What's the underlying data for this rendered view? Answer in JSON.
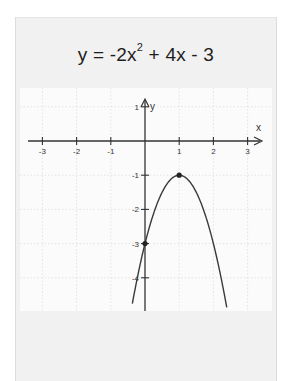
{
  "card": {
    "title_prefix": "y = -2x",
    "title_exp": "2",
    "title_suffix": " + 4x - 3"
  },
  "chart_data": {
    "type": "line",
    "function": "y = -2x^2 + 4x - 3",
    "xlabel": "x",
    "ylabel": "y",
    "xlim": [
      -3.5,
      3.5
    ],
    "ylim": [
      -5,
      1.2
    ],
    "x_ticks": [
      -3,
      -2,
      -1,
      1,
      2,
      3
    ],
    "x_tick_labels": [
      "-3",
      "-2",
      "-1",
      "1",
      "2",
      "3"
    ],
    "y_ticks": [
      1,
      -1,
      -2,
      -3,
      -4
    ],
    "y_tick_labels": [
      "1",
      "-1",
      "-2",
      "-3",
      "-4"
    ],
    "grid": true,
    "series": [
      {
        "name": "parabola",
        "x": [
          -0.35,
          -0.25,
          0,
          0.25,
          0.5,
          0.75,
          1,
          1.25,
          1.5,
          1.75,
          2,
          2.25,
          2.43
        ],
        "y": [
          -4.645,
          -4.125,
          -3,
          -2.125,
          -1.5,
          -1.125,
          -1,
          -1.125,
          -1.5,
          -2.125,
          -3,
          -4.125,
          -5.09
        ]
      }
    ],
    "points": [
      {
        "label": "vertex",
        "x": 1,
        "y": -1
      },
      {
        "label": "y-intercept",
        "x": 0,
        "y": -3
      }
    ],
    "colors": {
      "curve": "#3a3a3a",
      "axes": "#333333",
      "grid": "#d8d8d8",
      "card_bg": "#f1f1f1",
      "plot_bg": "#fbfbfb"
    }
  }
}
